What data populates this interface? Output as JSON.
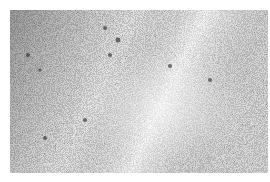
{
  "image": {
    "description": "Grayscale granular noise texture",
    "colors": {
      "background": "#ffffff",
      "dark": "#3a3a3a",
      "light": "#f2f2f2"
    }
  }
}
